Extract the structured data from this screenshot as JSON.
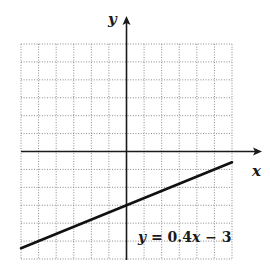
{
  "chart_data": {
    "type": "line",
    "title": "",
    "xlabel": "x",
    "ylabel": "y",
    "xlim": [
      -6,
      6
    ],
    "ylim": [
      -6,
      6
    ],
    "grid": true,
    "grid_step": 1,
    "series": [
      {
        "name": "y = 0.4x − 3",
        "slope": 0.4,
        "intercept": -3,
        "x": [
          -6,
          6
        ],
        "y": [
          -5.4,
          -0.6
        ]
      }
    ],
    "annotations": [
      {
        "text": "y = 0.4x − 3",
        "position": "lower-right, near line"
      }
    ]
  },
  "labels": {
    "x_axis": "x",
    "y_axis": "y",
    "equation": {
      "y": "y",
      "eq": " = 0.4",
      "x": "x",
      "rest": " − 3"
    }
  },
  "colors": {
    "line": "#111111",
    "axis": "#1a1a1a",
    "grid": "#8a8a8a",
    "background": "#ffffff"
  }
}
